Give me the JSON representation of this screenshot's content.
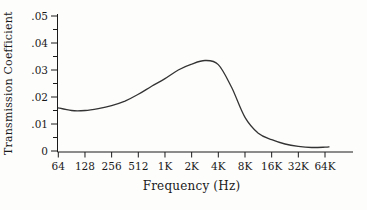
{
  "colors": {
    "background": "#fdfdfc",
    "axis": "#1a1a1a",
    "curve": "#333333",
    "text": "#1a1a1a"
  },
  "chart_data": {
    "type": "line",
    "title": "",
    "xlabel": "Frequency (Hz)",
    "ylabel": "Transmission Coefficient",
    "x_scale": "log2-octaves-from-64Hz",
    "x_ticks": [
      "64",
      "128",
      "256",
      "512",
      "1K",
      "2K",
      "4K",
      "8K",
      "16K",
      "32K",
      "64K"
    ],
    "y_ticks": [
      {
        "v": 0.05,
        "label": ".05"
      },
      {
        "v": 0.04,
        "label": ".04"
      },
      {
        "v": 0.03,
        "label": ".03"
      },
      {
        "v": 0.02,
        "label": ".02"
      },
      {
        "v": 0.01,
        "label": ".01"
      },
      {
        "v": 0.0,
        "label": "0"
      }
    ],
    "y_minor_ticks": [
      0.005,
      0.015,
      0.025,
      0.035,
      0.045
    ],
    "ylim": [
      0,
      0.05
    ],
    "grid": false,
    "legend": "none",
    "series": [
      {
        "name": "transmission coefficient vs frequency",
        "points_octave_value": [
          [
            0,
            0.016
          ],
          [
            0.5,
            0.015
          ],
          [
            1,
            0.015
          ],
          [
            1.5,
            0.0157
          ],
          [
            2,
            0.0168
          ],
          [
            2.5,
            0.0185
          ],
          [
            3,
            0.021
          ],
          [
            3.5,
            0.024
          ],
          [
            4,
            0.0268
          ],
          [
            4.5,
            0.03
          ],
          [
            5,
            0.0322
          ],
          [
            5.5,
            0.0335
          ],
          [
            6,
            0.032
          ],
          [
            6.5,
            0.0235
          ],
          [
            7,
            0.0125
          ],
          [
            7.5,
            0.0066
          ],
          [
            8,
            0.0042
          ],
          [
            8.5,
            0.0026
          ],
          [
            9,
            0.0017
          ],
          [
            9.5,
            0.0013
          ],
          [
            10,
            0.0014
          ],
          [
            10.15,
            0.0015
          ]
        ]
      }
    ]
  }
}
